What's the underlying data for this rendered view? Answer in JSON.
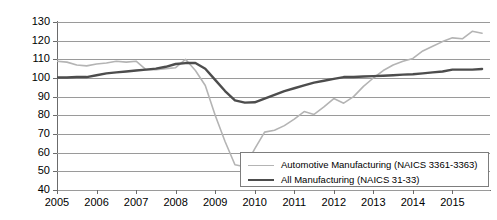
{
  "chart_data": {
    "type": "line",
    "title": "",
    "xlabel": "",
    "ylabel": "Production Index (base year 2007)",
    "xlim": [
      2005,
      2015.95
    ],
    "ylim": [
      40,
      130
    ],
    "ytick_step": 10,
    "grid": true,
    "legend_position": "bottom-right",
    "categories": [
      "2005",
      "2006",
      "2007",
      "2008",
      "2009",
      "2010",
      "2011",
      "2012",
      "2013",
      "2014",
      "2015"
    ],
    "x_tick_labels": [
      "2005",
      "2006",
      "2007",
      "2008",
      "2009",
      "2010",
      "2011",
      "2012",
      "2013",
      "2014",
      "2015"
    ],
    "y_tick_labels": [
      "40",
      "50",
      "60",
      "70",
      "80",
      "90",
      "100",
      "110",
      "120",
      "130"
    ],
    "series": [
      {
        "name": "Automotive Manufacturing (NAICS 3361-3363)",
        "color": "#b4b4b4",
        "x": [
          2005.0,
          2005.25,
          2005.5,
          2005.75,
          2006.0,
          2006.25,
          2006.5,
          2006.75,
          2007.0,
          2007.25,
          2007.5,
          2007.75,
          2008.0,
          2008.25,
          2008.5,
          2008.75,
          2009.0,
          2009.25,
          2009.5,
          2009.75,
          2010.0,
          2010.25,
          2010.5,
          2010.75,
          2011.0,
          2011.25,
          2011.5,
          2011.75,
          2012.0,
          2012.25,
          2012.5,
          2012.75,
          2013.0,
          2013.25,
          2013.5,
          2013.75,
          2014.0,
          2014.25,
          2014.5,
          2014.75,
          2015.0,
          2015.25,
          2015.5,
          2015.75
        ],
        "values": [
          109.0,
          108.5,
          107.0,
          106.5,
          107.5,
          108.0,
          109.0,
          108.5,
          109.0,
          104.5,
          104.5,
          105.0,
          105.5,
          110.0,
          104.0,
          96.0,
          80.0,
          66.0,
          53.5,
          52.5,
          62.0,
          71.0,
          72.0,
          74.5,
          78.0,
          82.0,
          80.5,
          84.5,
          89.0,
          86.5,
          90.0,
          95.5,
          100.0,
          104.0,
          107.0,
          109.0,
          110.5,
          114.5,
          117.0,
          119.5,
          121.5,
          121.0,
          125.0,
          124.0
        ]
      },
      {
        "name": "All Manufacturing (NAICS 31-33)",
        "color": "#4d4d4d",
        "x": [
          2005.0,
          2005.25,
          2005.5,
          2005.75,
          2006.0,
          2006.25,
          2006.5,
          2006.75,
          2007.0,
          2007.25,
          2007.5,
          2007.75,
          2008.0,
          2008.25,
          2008.5,
          2008.75,
          2009.0,
          2009.25,
          2009.5,
          2009.75,
          2010.0,
          2010.25,
          2010.5,
          2010.75,
          2011.0,
          2011.25,
          2011.5,
          2011.75,
          2012.0,
          2012.25,
          2012.5,
          2012.75,
          2013.0,
          2013.25,
          2013.5,
          2013.75,
          2014.0,
          2014.25,
          2014.5,
          2014.75,
          2015.0,
          2015.25,
          2015.5,
          2015.75
        ],
        "values": [
          100.3,
          100.3,
          100.5,
          100.5,
          101.5,
          102.5,
          103.0,
          103.5,
          104.0,
          104.5,
          105.0,
          106.0,
          107.5,
          108.0,
          108.0,
          105.0,
          99.0,
          93.0,
          88.0,
          86.8,
          87.0,
          89.0,
          91.0,
          93.0,
          94.5,
          96.0,
          97.5,
          98.5,
          99.5,
          100.5,
          100.5,
          100.8,
          101.0,
          101.2,
          101.5,
          101.8,
          102.0,
          102.5,
          103.0,
          103.5,
          104.5,
          104.5,
          104.5,
          104.8
        ]
      }
    ]
  },
  "legend": {
    "entries": [
      {
        "label": "Automotive Manufacturing (NAICS 3361-3363)",
        "color": "#b4b4b4"
      },
      {
        "label": "All Manufacturing (NAICS 31-33)",
        "color": "#4d4d4d"
      }
    ]
  },
  "axes": {
    "y_title": "Production Index (base year 2007)"
  }
}
